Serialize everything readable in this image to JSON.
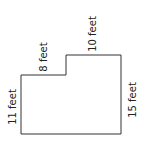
{
  "diagram": {
    "type": "rectilinear-polygon",
    "stroke_color": "#333333",
    "labels": {
      "left_side": "11 feet",
      "step_top": "8 feet",
      "top_side": "10 feet",
      "right_side": "15 feet"
    },
    "dimensions_ft": {
      "left_side": 11,
      "step_top": 8,
      "top_side": 10,
      "right_side": 15
    }
  }
}
